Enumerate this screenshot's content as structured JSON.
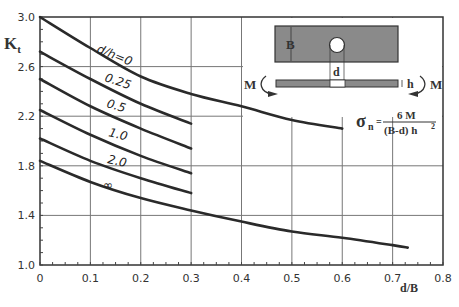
{
  "chart_data": {
    "type": "line",
    "title": "",
    "xlabel": "d/B",
    "ylabel": "K_t",
    "xlim": [
      0,
      0.8
    ],
    "ylim": [
      1.0,
      3.0
    ],
    "grid": true,
    "x_ticks": [
      "0",
      "0.1",
      "0.2",
      "0.3",
      "0.4",
      "0.5",
      "0.6",
      "0.7",
      "0.8"
    ],
    "y_ticks": [
      "1.0",
      "1.4",
      "1.8",
      "2.2",
      "2.6",
      "3.0"
    ],
    "series": [
      {
        "name": "d/h=0",
        "x": [
          0,
          0.1,
          0.2,
          0.3,
          0.4,
          0.5,
          0.6
        ],
        "values": [
          3.0,
          2.75,
          2.52,
          2.38,
          2.28,
          2.17,
          2.1
        ]
      },
      {
        "name": "0.25",
        "x": [
          0,
          0.1,
          0.2,
          0.3
        ],
        "values": [
          2.72,
          2.5,
          2.3,
          2.14
        ]
      },
      {
        "name": "0.5",
        "x": [
          0,
          0.1,
          0.2,
          0.3
        ],
        "values": [
          2.5,
          2.28,
          2.1,
          1.94
        ]
      },
      {
        "name": "1.0",
        "x": [
          0,
          0.1,
          0.2,
          0.3
        ],
        "values": [
          2.25,
          2.05,
          1.88,
          1.74
        ]
      },
      {
        "name": "2.0",
        "x": [
          0,
          0.1,
          0.2,
          0.3
        ],
        "values": [
          2.02,
          1.84,
          1.7,
          1.58
        ]
      },
      {
        "name": "∞",
        "x": [
          0,
          0.1,
          0.2,
          0.3,
          0.4,
          0.5,
          0.6,
          0.7,
          0.73
        ],
        "values": [
          1.84,
          1.67,
          1.54,
          1.44,
          1.35,
          1.27,
          1.22,
          1.16,
          1.14
        ]
      }
    ],
    "annotations": {
      "inset_labels": {
        "width": "B",
        "hole": "d",
        "thickness": "h",
        "moment_left": "M",
        "moment_right": "M"
      },
      "formula": {
        "lhs": "σ",
        "lhs_sub": "n",
        "eq": "=",
        "numerator": "6 M",
        "denominator": "(B-d) h",
        "denominator_sup": "2"
      }
    }
  }
}
